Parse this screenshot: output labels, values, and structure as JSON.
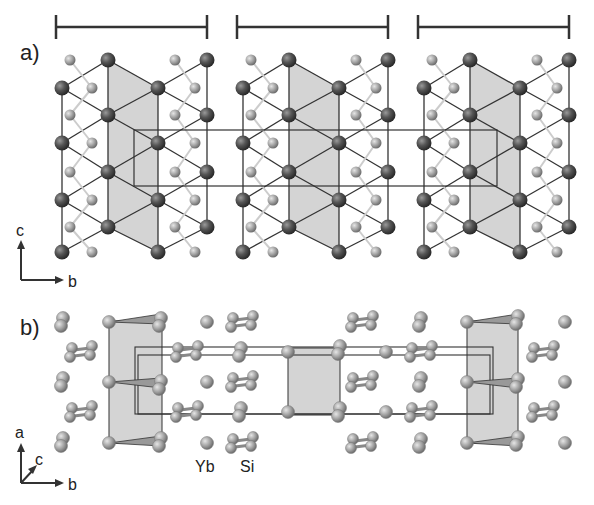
{
  "panel_a": {
    "label": "a)",
    "axes": {
      "vertical": "c",
      "horizontal": "b"
    },
    "block_offsets": [
      0,
      181,
      362
    ],
    "scale_bars": [
      [
        56,
        207
      ],
      [
        237,
        388
      ],
      [
        418,
        569
      ]
    ],
    "unit_cell": {
      "x1": 134,
      "x2": 497,
      "y1": 130,
      "y2": 186
    }
  },
  "panel_b": {
    "label": "b)",
    "axes": {
      "vertical": "a",
      "diagonal": "c",
      "horizontal": "b"
    },
    "legend": {
      "yb": "Yb",
      "si": "Si"
    },
    "shaded_rects": [
      [
        109,
        321,
        162,
        443
      ],
      [
        288,
        348,
        340,
        415
      ],
      [
        467,
        321,
        518,
        443
      ]
    ],
    "unit_cell": {
      "x1": 135,
      "x2": 493,
      "y1": 347,
      "y2": 414
    }
  },
  "colors": {
    "yb": "#555555",
    "si": "#a8a8a8",
    "shade": "#d4d4d4",
    "line": "#333333"
  }
}
